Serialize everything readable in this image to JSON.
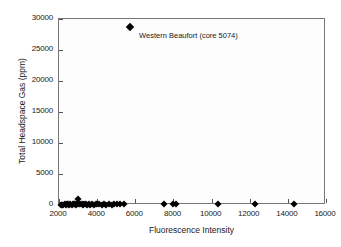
{
  "chart_data": {
    "type": "scatter",
    "title": "",
    "xlabel": "Fluorescence Intensity",
    "ylabel": "Total Headspace Gas (ppm)",
    "xlim": [
      2000,
      16000
    ],
    "ylim": [
      0,
      30000
    ],
    "xticks": [
      2000,
      4000,
      6000,
      8000,
      10000,
      12000,
      14000,
      16000
    ],
    "yticks": [
      0,
      5000,
      10000,
      15000,
      20000,
      25000,
      30000
    ],
    "xtick_labels": [
      "2000",
      "4000",
      "6000",
      "8000",
      "10000",
      "12000",
      "14000",
      "16000"
    ],
    "ytick_labels": [
      "0",
      "5000",
      "10000",
      "15000",
      "20000",
      "25000",
      "30000"
    ],
    "grid": false,
    "legend": "none",
    "marker": "filled-diamond",
    "marker_color": "#000000",
    "plot_background": "#fdfdfd",
    "frame_color": "#777777",
    "series": [
      {
        "name": "Headspace gas vs fluorescence",
        "points": [
          {
            "x": 2080,
            "y": 60
          },
          {
            "x": 2150,
            "y": 80
          },
          {
            "x": 2220,
            "y": 50
          },
          {
            "x": 2290,
            "y": 120
          },
          {
            "x": 2350,
            "y": 70
          },
          {
            "x": 2420,
            "y": 90
          },
          {
            "x": 2480,
            "y": 140
          },
          {
            "x": 2540,
            "y": 60
          },
          {
            "x": 2600,
            "y": 110
          },
          {
            "x": 2660,
            "y": 75
          },
          {
            "x": 2720,
            "y": 180
          },
          {
            "x": 2780,
            "y": 95
          },
          {
            "x": 2840,
            "y": 130
          },
          {
            "x": 2900,
            "y": 65
          },
          {
            "x": 2960,
            "y": 210
          },
          {
            "x": 3000,
            "y": 1000
          },
          {
            "x": 3050,
            "y": 120
          },
          {
            "x": 3110,
            "y": 85
          },
          {
            "x": 3180,
            "y": 150
          },
          {
            "x": 3250,
            "y": 70
          },
          {
            "x": 3320,
            "y": 95
          },
          {
            "x": 3400,
            "y": 130
          },
          {
            "x": 3480,
            "y": 60
          },
          {
            "x": 3560,
            "y": 110
          },
          {
            "x": 3650,
            "y": 80
          },
          {
            "x": 3740,
            "y": 160
          },
          {
            "x": 3830,
            "y": 70
          },
          {
            "x": 3920,
            "y": 100
          },
          {
            "x": 4010,
            "y": 90
          },
          {
            "x": 4120,
            "y": 130
          },
          {
            "x": 4240,
            "y": 60
          },
          {
            "x": 4360,
            "y": 110
          },
          {
            "x": 4480,
            "y": 80
          },
          {
            "x": 4620,
            "y": 140
          },
          {
            "x": 4760,
            "y": 70
          },
          {
            "x": 4900,
            "y": 100
          },
          {
            "x": 5050,
            "y": 120
          },
          {
            "x": 5200,
            "y": 85
          },
          {
            "x": 5420,
            "y": 95
          },
          {
            "x": 5720,
            "y": 28700
          },
          {
            "x": 7500,
            "y": 120
          },
          {
            "x": 8000,
            "y": 100
          },
          {
            "x": 8150,
            "y": 140
          },
          {
            "x": 10350,
            "y": 110
          },
          {
            "x": 12300,
            "y": 90
          },
          {
            "x": 14300,
            "y": 120
          }
        ]
      }
    ],
    "annotations": [
      {
        "text": "Western Beaufort (core 5074)",
        "x": 5720,
        "y": 28700,
        "label_x": 6200,
        "label_y": 27200
      }
    ]
  }
}
